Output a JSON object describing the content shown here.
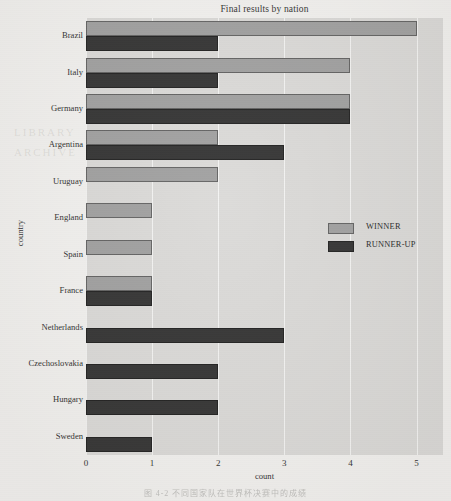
{
  "figure": {
    "title": "Final results by nation",
    "x_axis_title": "count",
    "y_axis_title": "country",
    "page_caption": "图 4-2  不同国家队在世界杯决赛中的成绩"
  },
  "legend": {
    "entries": [
      {
        "label": "WINNER",
        "color": "#9a9a9a"
      },
      {
        "label": "RUNNER-UP",
        "color": "#262626"
      }
    ]
  },
  "ghost_text": {
    "left_mark": "LIBRARY",
    "right_mark": "ARCHIVE"
  },
  "chart_data": {
    "type": "bar",
    "orientation": "horizontal",
    "title": "Final results by nation",
    "xlabel": "count",
    "ylabel": "country",
    "xlim": [
      0,
      5.4
    ],
    "xticks": [
      0,
      1,
      2,
      3,
      4,
      5
    ],
    "grid": true,
    "legend_position": "center-right",
    "categories": [
      "Brazil",
      "Italy",
      "Germany",
      "Argentina",
      "Uruguay",
      "England",
      "Spain",
      "France",
      "Netherlands",
      "Czechoslovakia",
      "Hungary",
      "Sweden"
    ],
    "series": [
      {
        "name": "WINNER",
        "color": "#9a9a9a",
        "values": [
          5,
          4,
          4,
          2,
          2,
          1,
          1,
          1,
          0,
          0,
          0,
          0
        ]
      },
      {
        "name": "RUNNER-UP",
        "color": "#262626",
        "values": [
          2,
          2,
          4,
          3,
          0,
          0,
          0,
          1,
          3,
          2,
          2,
          1
        ]
      }
    ]
  }
}
